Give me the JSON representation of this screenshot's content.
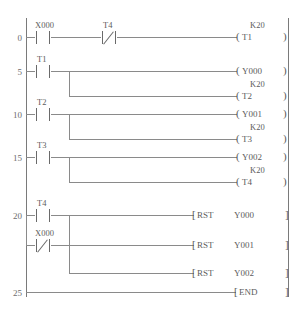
{
  "diagram": {
    "language": "ladder",
    "end_marker": "END",
    "reset_mnemonic": "RST"
  },
  "rungs": [
    {
      "step": "0",
      "contacts": [
        {
          "label": "X000",
          "type": "NO"
        },
        {
          "label": "T4",
          "type": "NC"
        }
      ],
      "outputs": [
        {
          "kind": "coil",
          "label": "T1",
          "preset": "K20"
        }
      ]
    },
    {
      "step": "5",
      "contacts": [
        {
          "label": "T1",
          "type": "NO"
        }
      ],
      "outputs": [
        {
          "kind": "coil",
          "label": "Y000",
          "preset": ""
        },
        {
          "kind": "coil",
          "label": "T2",
          "preset": "K20"
        }
      ]
    },
    {
      "step": "10",
      "contacts": [
        {
          "label": "T2",
          "type": "NO"
        }
      ],
      "outputs": [
        {
          "kind": "coil",
          "label": "Y001",
          "preset": ""
        },
        {
          "kind": "coil",
          "label": "T3",
          "preset": "K20"
        }
      ]
    },
    {
      "step": "15",
      "contacts": [
        {
          "label": "T3",
          "type": "NO"
        }
      ],
      "outputs": [
        {
          "kind": "coil",
          "label": "Y002",
          "preset": ""
        },
        {
          "kind": "coil",
          "label": "T4",
          "preset": "K20"
        }
      ]
    },
    {
      "step": "20",
      "contacts": [
        {
          "label": "T4",
          "type": "NO"
        },
        {
          "label": "X000",
          "type": "NC"
        }
      ],
      "outputs": [
        {
          "kind": "block",
          "mnemonic": "RST",
          "operand": "Y000"
        },
        {
          "kind": "block",
          "mnemonic": "RST",
          "operand": "Y001"
        },
        {
          "kind": "block",
          "mnemonic": "RST",
          "operand": "Y002"
        }
      ]
    },
    {
      "step": "25",
      "contacts": [],
      "outputs": [
        {
          "kind": "block",
          "mnemonic": "END",
          "operand": ""
        }
      ]
    }
  ],
  "symbols": {
    "coil_open": "(",
    "coil_close": ")",
    "block_open": "[",
    "block_close": "]"
  },
  "colors": {
    "line": "#8a8a8a",
    "text": "#5c5c5c",
    "rail": "#7a7a7a",
    "background": "#ffffff"
  }
}
